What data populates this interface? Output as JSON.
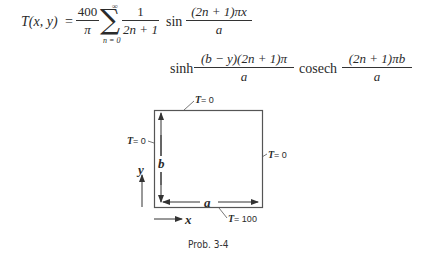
{
  "equation": {
    "lhs": "T(x, y)",
    "equals": "=",
    "coef_num": "400",
    "coef_den": "π",
    "sum_symbol": "∑",
    "sum_upper": "∞",
    "sum_lower": "n = 0",
    "term1_num": "1",
    "term1_den": "2n + 1",
    "fn_sin": "sin",
    "term2_num": "(2n + 1)πx",
    "term2_den": "a",
    "fn_sinh": "sinh",
    "term3_num": "(b − y)(2n + 1)π",
    "term3_den": "a",
    "fn_cosech": "cosech",
    "term4_num": "(2n + 1)πb",
    "term4_den": "a"
  },
  "diagram": {
    "top_label_T": "T",
    "top_label_val": "= 0",
    "left_label_T": "T",
    "left_label_val": "= 0",
    "right_label_T": "T",
    "right_label_val": "= 0",
    "bottom_label_T": "T",
    "bottom_label_val": "= 100",
    "dim_height": "b",
    "dim_width": "a",
    "axis_y": "y",
    "axis_x": "x"
  },
  "caption": "Prob. 3-4"
}
